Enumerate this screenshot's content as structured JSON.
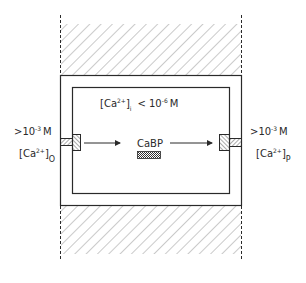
{
  "diagram": {
    "cell_interior": {
      "label_main": "[Ca",
      "label_sup": "2+",
      "label_close": "]",
      "label_sub": "i",
      "label_relation": "< 10",
      "label_exp": "-6",
      "label_unit": "M"
    },
    "left_side": {
      "concentration_prefix": ">10",
      "concentration_exp": "-3",
      "concentration_unit": "M",
      "species_open": "[Ca",
      "species_sup": "2+",
      "species_close": "]",
      "species_sub": "O"
    },
    "right_side": {
      "concentration_prefix": ">10",
      "concentration_exp": "-3",
      "concentration_unit": "M",
      "species_open": "[Ca",
      "species_sup": "2+",
      "species_close": "]",
      "species_sub": "P"
    },
    "carrier": {
      "label": "CaBP"
    },
    "colors": {
      "line": "#2a2a2a",
      "hatch": "#6a6a6a",
      "background": "#ffffff"
    }
  }
}
